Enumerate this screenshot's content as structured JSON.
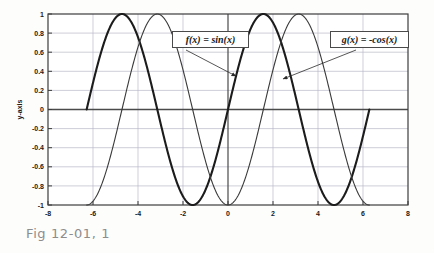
{
  "caption": "Fig 12-01, 1",
  "chart_data": {
    "type": "line",
    "title": "",
    "xlabel": "x-axis",
    "ylabel": "y-axis",
    "xlim": [
      -8,
      8
    ],
    "ylim": [
      -1,
      1
    ],
    "xticks": [
      "-8",
      "-6",
      "-4",
      "-2",
      "0",
      "2",
      "4",
      "6",
      "8"
    ],
    "xtick_values": [
      -8,
      -6,
      -4,
      -2,
      0,
      2,
      4,
      6,
      8
    ],
    "yticks": [
      "-1",
      "-0.8",
      "-0.6",
      "-0.4",
      "-0.2",
      "0",
      "0.2",
      "0.4",
      "0.6",
      "0.8",
      "1"
    ],
    "ytick_values": [
      -1,
      -0.8,
      -0.6,
      -0.4,
      -0.2,
      0,
      0.2,
      0.4,
      0.6,
      0.8,
      1
    ],
    "grid": true,
    "legend_position": "annotated-callouts",
    "domain": [
      -6.2832,
      6.2832
    ],
    "series": [
      {
        "name": "f(x) = sin(x)",
        "expression": "sin",
        "amplitude": 1,
        "sign": 1,
        "color": "#1c1c1c",
        "width": 2.1
      },
      {
        "name": "g(x) = -cos(x)",
        "expression": "cos",
        "amplitude": 1,
        "sign": -1,
        "color": "#3a3a3a",
        "width": 1.1
      }
    ],
    "annotations": [
      {
        "id": "anno-sin",
        "label": "f(x) = sin(x)",
        "target_x": 0.35,
        "target_y": 0.35
      },
      {
        "id": "anno-cos",
        "label": "g(x) = -cos(x)",
        "target_x": 2.45,
        "target_y": 0.32
      }
    ],
    "colors": {
      "axis": "#3d3d3d",
      "grid": "#b9b9c9",
      "zero_axis": "#4a4a4a",
      "text": "#1a1a1a",
      "caption": "#8d8d8d"
    }
  }
}
